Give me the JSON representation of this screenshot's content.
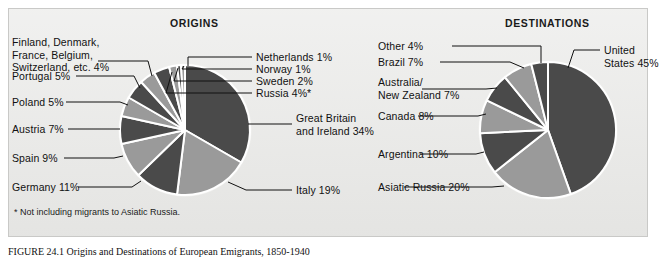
{
  "figure": {
    "caption": "FIGURE 24.1 Origins and Destinations of European Emigrants, 1850-1940",
    "footnote": "* Not including migrants to Asiatic Russia.",
    "panel_color": "#e9e9e7",
    "slice_dark": "#4a4a4a",
    "slice_light": "#9a9a9a",
    "stroke_color": "#ffffff",
    "leader_color": "#111111"
  },
  "chart_data": [
    {
      "type": "pie",
      "title": "ORIGINS",
      "categories": [
        "Great Britain and Ireland",
        "Italy",
        "Germany",
        "Spain",
        "Austria",
        "Poland",
        "Portugal",
        "Finland, Denmark, France, Belgium, Switzerland, etc.",
        "Russia",
        "Sweden",
        "Norway",
        "Netherlands"
      ],
      "values": [
        34,
        19,
        11,
        9,
        7,
        5,
        5,
        4,
        4,
        2,
        1,
        1
      ],
      "unit": "%",
      "start_angle_deg": 0,
      "direction": "clockwise",
      "labels": [
        {
          "id": "great-britain-ireland",
          "line1": "Great Britain",
          "line2": "and Ireland 34%",
          "value": 34
        },
        {
          "id": "italy",
          "line1": "Italy 19%",
          "line2": "",
          "value": 19
        },
        {
          "id": "germany",
          "line1": "Germany 11%",
          "line2": "",
          "value": 11
        },
        {
          "id": "spain",
          "line1": "Spain 9%",
          "line2": "",
          "value": 9
        },
        {
          "id": "austria",
          "line1": "Austria 7%",
          "line2": "",
          "value": 7
        },
        {
          "id": "poland",
          "line1": "Poland 5%",
          "line2": "",
          "value": 5
        },
        {
          "id": "portugal",
          "line1": "Portugal 5%",
          "line2": "",
          "value": 5
        },
        {
          "id": "finland-group",
          "line1": "Finland, Denmark,",
          "line2": "France, Belgium,",
          "line3": "Switzerland, etc. 4%",
          "value": 4
        },
        {
          "id": "russia",
          "line1": "Russia 4%*",
          "line2": "",
          "value": 4
        },
        {
          "id": "sweden",
          "line1": "Sweden 2%",
          "line2": "",
          "value": 2
        },
        {
          "id": "norway",
          "line1": "Norway 1%",
          "line2": "",
          "value": 1
        },
        {
          "id": "netherlands",
          "line1": "Netherlands 1%",
          "line2": "",
          "value": 1
        }
      ]
    },
    {
      "type": "pie",
      "title": "DESTINATIONS",
      "categories": [
        "United States",
        "Asiatic Russia",
        "Argentina",
        "Canada",
        "Australia/New Zealand",
        "Brazil",
        "Other"
      ],
      "values": [
        45,
        20,
        10,
        8,
        7,
        7,
        4
      ],
      "unit": "%",
      "start_angle_deg": 0,
      "direction": "clockwise",
      "labels": [
        {
          "id": "united-states",
          "line1": "United",
          "line2": "States 45%",
          "value": 45
        },
        {
          "id": "asiatic-russia",
          "line1": "Asiatic Russia 20%",
          "line2": "",
          "value": 20
        },
        {
          "id": "argentina",
          "line1": "Argentina 10%",
          "line2": "",
          "value": 10
        },
        {
          "id": "canada",
          "line1": "Canada 8%",
          "line2": "",
          "value": 8
        },
        {
          "id": "australia-new-zealand",
          "line1": "Australia/",
          "line2": "New Zealand 7%",
          "value": 7
        },
        {
          "id": "brazil",
          "line1": "Brazil 7%",
          "line2": "",
          "value": 7
        },
        {
          "id": "other",
          "line1": "Other 4%",
          "line2": "",
          "value": 4
        }
      ]
    }
  ]
}
